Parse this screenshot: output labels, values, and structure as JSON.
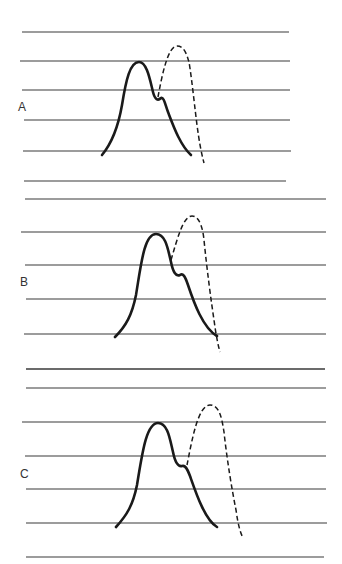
{
  "figure": {
    "background": "#ffffff",
    "line_color": "#3a3a3a",
    "curve_color": "#1a1a1a",
    "panels": [
      {
        "label": "A",
        "label_pos": [
          18,
          101
        ],
        "guide_lines": [
          {
            "y": 32,
            "x1": 22,
            "x2": 289
          },
          {
            "y": 61,
            "x1": 20,
            "x2": 290
          },
          {
            "y": 90,
            "x1": 22,
            "x2": 290
          },
          {
            "y": 120,
            "x1": 24,
            "x2": 290
          },
          {
            "y": 151,
            "x1": 23,
            "x2": 291
          },
          {
            "y": 181,
            "x1": 24,
            "x2": 286
          }
        ],
        "solid_curve": "M102,155 C112,143 118,128 122,105 C126,80 130,62 139,62 C147,62 150,80 153,92 C155,100 158,101 161,98 C164,97 165,104 168,112 C173,125 180,145 191,155",
        "dashed_curve": "M158,97 C162,75 168,46 177,46 C185,46 187,56 189,62 C192,80 195,110 197,125 C199,140 201,152 204,163"
      },
      {
        "label": "B",
        "label_pos": [
          20,
          276
        ],
        "guide_lines": [
          {
            "y": 199,
            "x1": 25,
            "x2": 326
          },
          {
            "y": 232,
            "x1": 21,
            "x2": 326
          },
          {
            "y": 265,
            "x1": 25,
            "x2": 326
          },
          {
            "y": 299,
            "x1": 26,
            "x2": 326
          },
          {
            "y": 334,
            "x1": 24,
            "x2": 326
          },
          {
            "y": 369,
            "x1": 26,
            "x2": 325
          }
        ],
        "solid_curve": "M115,337 C126,326 132,315 136,295 C141,265 144,234 156,234 C166,234 168,250 171,262 C173,272 176,277 180,275 C183,273 185,276 188,285 C194,303 203,328 217,336",
        "dashed_curve": "M171,260 C177,240 183,216 192,216 C200,216 203,230 204,240 C207,270 211,300 214,320 C216,335 218,345 220,352"
      },
      {
        "label": "C",
        "label_pos": [
          20,
          468
        ],
        "guide_lines": [
          {
            "y": 369,
            "x1": 26,
            "x2": 325
          },
          {
            "y": 388,
            "x1": 26,
            "x2": 326
          },
          {
            "y": 422,
            "x1": 22,
            "x2": 326
          },
          {
            "y": 456,
            "x1": 25,
            "x2": 326
          },
          {
            "y": 489,
            "x1": 26,
            "x2": 326
          },
          {
            "y": 523,
            "x1": 26,
            "x2": 327
          },
          {
            "y": 557,
            "x1": 26,
            "x2": 324
          }
        ],
        "solid_curve": "M116,527 C127,515 133,505 137,485 C142,455 146,423 158,423 C168,423 170,440 173,452 C175,462 178,467 182,466 C185,465 187,468 190,476 C196,493 205,520 217,527",
        "dashed_curve": "M187,465 C192,440 198,405 210,405 C220,405 222,420 224,432 C227,460 232,490 236,510 C238,524 240,532 243,538"
      }
    ]
  }
}
